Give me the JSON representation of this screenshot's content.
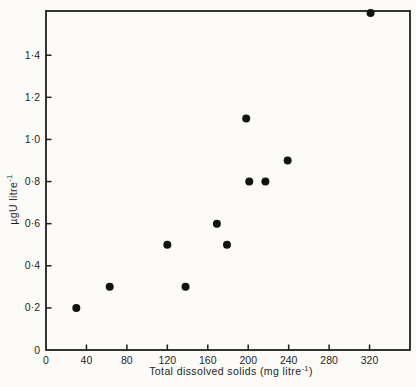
{
  "figure": {
    "background": "#fcfbf8",
    "axis_color": "#1f1f1f"
  },
  "chart_data": {
    "type": "scatter",
    "title": "",
    "xlabel_pre": "Total dissolved solids (mg litre",
    "xlabel_sup": "-1",
    "xlabel_post": ")",
    "ylabel_pre": "µgU litre",
    "ylabel_sup": "-1",
    "xlim": [
      0,
      360
    ],
    "ylim": [
      0,
      1.61
    ],
    "grid": false,
    "frame": true,
    "legend": "none",
    "point_color": "#121212",
    "point_radius": 4,
    "x_ticks": [
      {
        "value": 0,
        "label": "0"
      },
      {
        "value": 40,
        "label": "40"
      },
      {
        "value": 80,
        "label": "80"
      },
      {
        "value": 120,
        "label": "120"
      },
      {
        "value": 160,
        "label": "160"
      },
      {
        "value": 200,
        "label": "200"
      },
      {
        "value": 240,
        "label": "240"
      },
      {
        "value": 280,
        "label": "280"
      },
      {
        "value": 320,
        "label": "320"
      }
    ],
    "y_ticks": [
      {
        "value": 0,
        "label": "0"
      },
      {
        "value": 0.2,
        "label": "0·2"
      },
      {
        "value": 0.4,
        "label": "0·4"
      },
      {
        "value": 0.6,
        "label": "0·6"
      },
      {
        "value": 0.8,
        "label": "0·8"
      },
      {
        "value": 1.0,
        "label": "1·0"
      },
      {
        "value": 1.2,
        "label": "1·2"
      },
      {
        "value": 1.4,
        "label": "1·4"
      }
    ],
    "points": [
      [
        30,
        0.2
      ],
      [
        63,
        0.3
      ],
      [
        120,
        0.5
      ],
      [
        138,
        0.3
      ],
      [
        169,
        0.6
      ],
      [
        179,
        0.5
      ],
      [
        198,
        1.1
      ],
      [
        201,
        0.8
      ],
      [
        217,
        0.8
      ],
      [
        239,
        0.9
      ],
      [
        321,
        1.6
      ]
    ]
  }
}
